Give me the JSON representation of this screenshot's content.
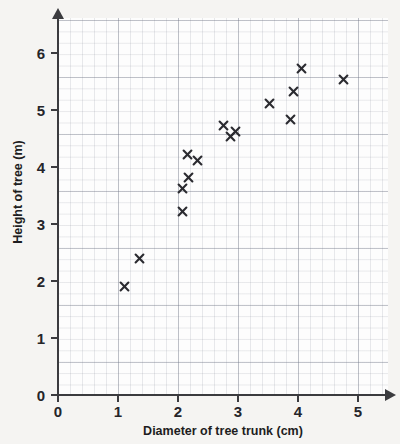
{
  "chart_data": {
    "type": "scatter",
    "title": "",
    "xlabel": "Diameter of tree trunk (cm)",
    "ylabel": "Height of tree (m)",
    "xlim": [
      0,
      5.5
    ],
    "ylim": [
      0,
      6.6
    ],
    "xticks": [
      "0",
      "1",
      "2",
      "3",
      "4",
      "5"
    ],
    "yticks": [
      "0",
      "1",
      "2",
      "3",
      "4",
      "5",
      "6"
    ],
    "grid": "minor and major gridlines, square graph paper",
    "legend": "none",
    "marker": "x-cross",
    "marker_color": "#2b2b30",
    "points": [
      {
        "x": 1.1,
        "y": 1.9
      },
      {
        "x": 1.35,
        "y": 2.4
      },
      {
        "x": 2.08,
        "y": 3.22
      },
      {
        "x": 2.07,
        "y": 3.62
      },
      {
        "x": 2.17,
        "y": 3.82
      },
      {
        "x": 2.15,
        "y": 4.22
      },
      {
        "x": 2.33,
        "y": 4.12
      },
      {
        "x": 2.75,
        "y": 4.72
      },
      {
        "x": 2.88,
        "y": 4.53
      },
      {
        "x": 2.95,
        "y": 4.62
      },
      {
        "x": 3.53,
        "y": 5.12
      },
      {
        "x": 3.87,
        "y": 4.84
      },
      {
        "x": 3.93,
        "y": 5.33
      },
      {
        "x": 4.05,
        "y": 5.73
      },
      {
        "x": 4.75,
        "y": 5.53
      }
    ]
  },
  "axes": {
    "x_title": "Diameter of tree trunk (cm)",
    "y_title": "Height of tree (m)",
    "x_tick_labels": [
      "0",
      "1",
      "2",
      "3",
      "4",
      "5"
    ],
    "y_tick_labels": [
      "0",
      "1",
      "2",
      "3",
      "4",
      "5",
      "6"
    ]
  },
  "colors": {
    "page_background": "#f5f4f2",
    "plot_background": "#fdfdfd",
    "axis": "#3b3b3f",
    "grid_minor": "#c9cdd6",
    "grid_major": "#a8aebb",
    "marker": "#2b2b30",
    "text": "#1d1d21"
  }
}
